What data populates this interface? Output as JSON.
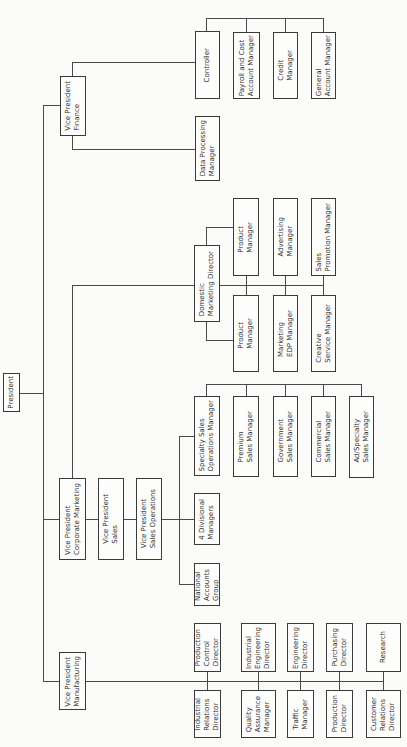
{
  "chart_title": "",
  "president": {
    "label": "President"
  },
  "finance": {
    "vp": "Vice President\nFinance",
    "controller": "Controller",
    "data_processing": "Data Processing\nManager",
    "controller_reports": [
      "Payroll and Cost\nAccount Manager",
      "Credit\nManager",
      "General\nAccount Manager"
    ]
  },
  "marketing": {
    "domestic_director": "Domestic\nMarketing Director",
    "top_row": [
      "Product\nManager",
      "Advertising\nManager",
      "Sales\nPromotion Manager"
    ],
    "bottom_row": [
      "Product\nManager",
      "Marketing\nEDP Manager",
      "Creative\nService Manager"
    ]
  },
  "sales": {
    "vp_corporate_marketing": "Vice President\nCorporate Marketing",
    "vp_sales": "Vice President\nSales",
    "vp_sales_operations": "Vice President\nSales Operations",
    "specialty_ops": "Specialty Sales\nOperations Manager",
    "divisional": "4 Divisional\nManagers",
    "national_accounts": "National\nAccounts\nGroup",
    "specialty_reports": [
      "Premium\nSales Manager",
      "Government\nSales Manager",
      "Commercial\nSales Manager",
      "Ad/Specialty\nSales Manager"
    ]
  },
  "manufacturing": {
    "vp": "Vice President\nManufacturing",
    "top_row": [
      "Production\nControl\nDirector",
      "Industrial\nEngineering\nDirector",
      "Engineering\nDirector",
      "Purchasing\nDirector",
      "Research"
    ],
    "bottom_row": [
      "Industrial\nRelations\nDirector",
      "Quality\nAssurance\nManager",
      "Traffic\nManager",
      "Production\nDirector",
      "Customer\nRelations\nDirector"
    ]
  }
}
